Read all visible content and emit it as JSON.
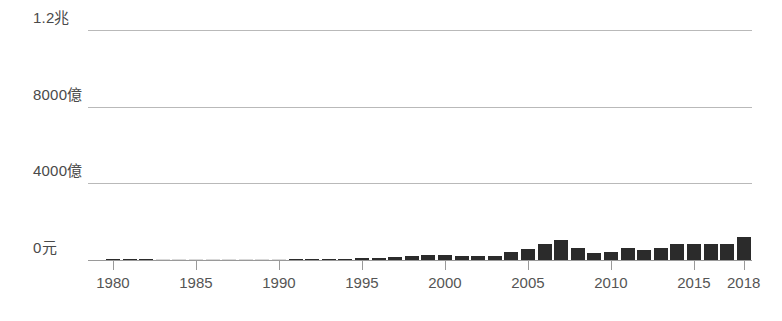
{
  "chart_data": {
    "type": "bar",
    "title": "",
    "subtitle": "",
    "xlabel": "",
    "ylabel": "",
    "grid": true,
    "legend": false,
    "ylim": [
      0,
      1200000000000
    ],
    "xlim": [
      1979,
      2019
    ],
    "y_ticks": [
      {
        "value": 0,
        "label": "0元"
      },
      {
        "value": 400000000000,
        "label": "4000億"
      },
      {
        "value": 800000000000,
        "label": "8000億"
      },
      {
        "value": 1200000000000,
        "label": "1.2兆"
      }
    ],
    "x_ticks": [
      {
        "value": 1980,
        "label": "1980"
      },
      {
        "value": 1985,
        "label": "1985"
      },
      {
        "value": 1990,
        "label": "1990"
      },
      {
        "value": 1995,
        "label": "1995"
      },
      {
        "value": 2000,
        "label": "2000"
      },
      {
        "value": 2005,
        "label": "2005"
      },
      {
        "value": 2010,
        "label": "2010"
      },
      {
        "value": 2015,
        "label": "2015"
      },
      {
        "value": 2018,
        "label": "2018"
      }
    ],
    "series": [
      {
        "name": "金額",
        "color": "#2b2b2b",
        "estimated_color": "#d9d9d9",
        "unit": "億元",
        "points": [
          {
            "x": 1980,
            "value": 2,
            "estimated": false
          },
          {
            "x": 1981,
            "value": 3,
            "estimated": false
          },
          {
            "x": 1982,
            "value": 4,
            "estimated": false
          },
          {
            "x": 1983,
            "value": 10,
            "estimated": true
          },
          {
            "x": 1984,
            "value": 28,
            "estimated": true
          },
          {
            "x": 1985,
            "value": 40,
            "estimated": true
          },
          {
            "x": 1986,
            "value": 40,
            "estimated": true
          },
          {
            "x": 1987,
            "value": 48,
            "estimated": true
          },
          {
            "x": 1988,
            "value": 48,
            "estimated": true
          },
          {
            "x": 1989,
            "value": 48,
            "estimated": true
          },
          {
            "x": 1990,
            "value": 30,
            "estimated": true
          },
          {
            "x": 1991,
            "value": 12,
            "estimated": false
          },
          {
            "x": 1992,
            "value": 38,
            "estimated": false
          },
          {
            "x": 1993,
            "value": 55,
            "estimated": false
          },
          {
            "x": 1994,
            "value": 60,
            "estimated": false
          },
          {
            "x": 1995,
            "value": 90,
            "estimated": false
          },
          {
            "x": 1996,
            "value": 125,
            "estimated": false
          },
          {
            "x": 1997,
            "value": 175,
            "estimated": false
          },
          {
            "x": 1998,
            "value": 235,
            "estimated": false
          },
          {
            "x": 1999,
            "value": 240,
            "estimated": false
          },
          {
            "x": 2000,
            "value": 245,
            "estimated": false
          },
          {
            "x": 2001,
            "value": 215,
            "estimated": false
          },
          {
            "x": 2002,
            "value": 205,
            "estimated": false
          },
          {
            "x": 2003,
            "value": 215,
            "estimated": false
          },
          {
            "x": 2004,
            "value": 420,
            "estimated": false
          },
          {
            "x": 2005,
            "value": 560,
            "estimated": false
          },
          {
            "x": 2006,
            "value": 850,
            "estimated": false
          },
          {
            "x": 2007,
            "value": 1050,
            "estimated": false
          },
          {
            "x": 2008,
            "value": 620,
            "estimated": false
          },
          {
            "x": 2009,
            "value": 390,
            "estimated": false
          },
          {
            "x": 2010,
            "value": 440,
            "estimated": false
          },
          {
            "x": 2011,
            "value": 640,
            "estimated": false
          },
          {
            "x": 2012,
            "value": 510,
            "estimated": false
          },
          {
            "x": 2013,
            "value": 620,
            "estimated": false
          },
          {
            "x": 2014,
            "value": 820,
            "estimated": false
          },
          {
            "x": 2015,
            "value": 855,
            "estimated": false
          },
          {
            "x": 2016,
            "value": 830,
            "estimated": false
          },
          {
            "x": 2017,
            "value": 835,
            "estimated": false
          },
          {
            "x": 2018,
            "value": 1195,
            "estimated": false
          }
        ]
      }
    ]
  }
}
